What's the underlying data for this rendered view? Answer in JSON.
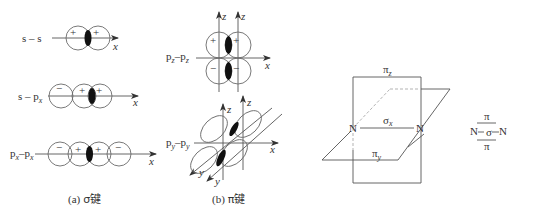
{
  "figure": {
    "panel_a": {
      "caption_prefix": "(a)",
      "caption_symbol": "σ键",
      "rows": [
        {
          "label": "s – s",
          "axis": "x",
          "lobes": [
            {
              "sign": "+"
            },
            {
              "sign": "+"
            }
          ]
        },
        {
          "label_main": "s – p",
          "label_sub": "x",
          "axis": "x",
          "lobes": [
            {
              "sign": "−"
            },
            {
              "sign": "+"
            },
            {
              "sign": "+"
            }
          ]
        },
        {
          "label_main1": "p",
          "label_sub1": "x",
          "label_dash": "–",
          "label_main2": "p",
          "label_sub2": "x",
          "axis": "x",
          "lobes": [
            {
              "sign": "−"
            },
            {
              "sign": "+"
            },
            {
              "sign": "+"
            },
            {
              "sign": "−"
            }
          ]
        }
      ]
    },
    "panel_b": {
      "caption_prefix": "(b)",
      "caption_symbol": "π键",
      "pz": {
        "label_main1": "p",
        "label_sub1": "z",
        "label_dash": "–",
        "label_main2": "p",
        "label_sub2": "z",
        "axis_x": "x",
        "axis_z1": "z",
        "axis_z2": "z",
        "signs": {
          "upper_left": "+",
          "upper_right": "+",
          "lower_left": "−",
          "lower_right": "−"
        }
      },
      "py": {
        "label_main1": "p",
        "label_sub1": "y",
        "label_dash": "–",
        "label_main2": "p",
        "label_sub2": "y",
        "axis_x": "x",
        "axis_z1": "z",
        "axis_z2": "z",
        "axis_y1": "y",
        "axis_y2": "y"
      }
    },
    "n2_planes": {
      "pi_z_main": "π",
      "pi_z_sub": "z",
      "sigma_x_main": "σ",
      "sigma_x_sub": "x",
      "pi_y_main": "π",
      "pi_y_sub": "y",
      "atom_left": "N",
      "atom_right": "N"
    },
    "n2_bond_scheme": {
      "atom_left": "N",
      "atom_right": "N",
      "top_bond": "π",
      "middle_bond": "σ",
      "bottom_bond": "π"
    }
  }
}
